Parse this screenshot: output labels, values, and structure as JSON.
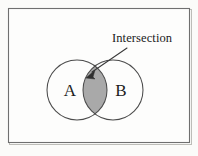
{
  "figure": {
    "background_color": "#fbfbf9",
    "frame": {
      "name": "figure-border",
      "stroke_color": "#6f6f6f",
      "x": 8,
      "y": 8,
      "width": 182,
      "height": 135
    }
  },
  "diagram": {
    "type": "venn",
    "sets": [
      {
        "label": "A",
        "center_x": 77,
        "center_y": 90,
        "radius": 30,
        "fill": "none",
        "stroke_color": "#4b4b4b"
      },
      {
        "label": "B",
        "center_x": 113,
        "center_y": 90,
        "radius": 30,
        "fill": "none",
        "stroke_color": "#4b4b4b"
      }
    ],
    "intersection": {
      "label": "Intersection",
      "fill_color": "#a9a9a9",
      "shaded": true
    },
    "callout": {
      "text": "Intersection",
      "text_x": 112,
      "text_y": 42,
      "leader_from_x": 124,
      "leader_from_y": 48,
      "leader_to_x": 90,
      "leader_to_y": 73,
      "arrow_color": "#2f2f2f"
    }
  },
  "labels": {
    "set_a": "A",
    "set_b": "B",
    "intersection": "Intersection"
  }
}
